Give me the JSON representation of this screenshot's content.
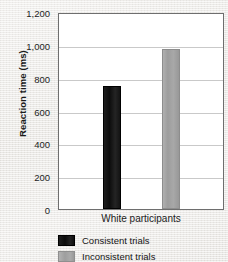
{
  "chart_data": {
    "type": "bar",
    "title": "",
    "xlabel": "",
    "ylabel": "Reaction time (ms)",
    "categories": [
      "White participants"
    ],
    "series": [
      {
        "name": "Consistent trials",
        "values": [
          750
        ],
        "color": "#111111"
      },
      {
        "name": "Inconsistent trials",
        "values": [
          975
        ],
        "color": "#a2a2a2"
      }
    ],
    "ylim": [
      0,
      1200
    ],
    "yticks": [
      0,
      200,
      400,
      600,
      800,
      1000,
      1200
    ],
    "ytick_labels": [
      "0",
      "200",
      "400",
      "600",
      "800",
      "1,000",
      "1,200"
    ],
    "grid": true,
    "legend_position": "bottom-left"
  },
  "axis": {
    "y_title": "Reaction time (ms)"
  },
  "legend": {
    "items": [
      {
        "label": "Consistent trials",
        "swatch": "black-swatch"
      },
      {
        "label": "Inconsistent trials",
        "swatch": "gray-swatch"
      }
    ]
  }
}
